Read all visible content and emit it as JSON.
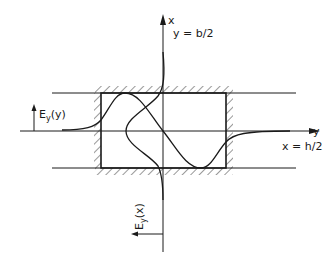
{
  "diagram": {
    "type": "waveguide-field-distribution",
    "axes": {
      "vertical": {
        "label": "x",
        "boundary_label": "y = b/2"
      },
      "horizontal": {
        "label": "y",
        "boundary_label": "x = h/2"
      }
    },
    "curves": {
      "left_label_main": "E",
      "left_label_sub": "y",
      "left_label_arg": "(y)",
      "bottom_label_main": "E",
      "bottom_label_sub": "y",
      "bottom_label_arg": "(x)"
    },
    "colors": {
      "stroke": "#1a1a1a",
      "background": "#ffffff"
    }
  }
}
